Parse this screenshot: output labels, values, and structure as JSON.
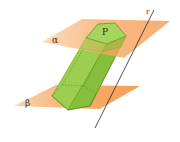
{
  "figure": {
    "labels": {
      "plane_top": "α",
      "plane_bottom": "β",
      "prism_base": "P",
      "line": "r"
    },
    "colors": {
      "plane": "#f5a05a",
      "prism": "#8cc63f",
      "prism_edge": "#5a8a1e",
      "line": "#222222"
    }
  }
}
